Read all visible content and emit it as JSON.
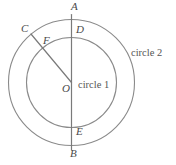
{
  "figure": {
    "width": 176,
    "height": 165,
    "background_color": "#ffffff",
    "stroke_color": "#8a8a8a",
    "label_color": "#4a4a4a"
  },
  "labels": {
    "A": "A",
    "B": "B",
    "C": "C",
    "D": "D",
    "E": "E",
    "F": "F",
    "O": "O",
    "circle_1": "circle 1",
    "circle_2": "circle 2"
  },
  "geometry": {
    "center": {
      "x": 71.5,
      "y": 82.5,
      "label": "O"
    },
    "circles": [
      {
        "name": "circle 1",
        "role": "inner",
        "cx": 71.5,
        "cy": 82.5,
        "r": 45.0
      },
      {
        "name": "circle 2",
        "role": "outer",
        "cx": 71.5,
        "cy": 82.5,
        "r": 63.0
      }
    ],
    "segments": [
      {
        "name": "diameter-AB",
        "from": "A",
        "to": "B",
        "x1": 71.5,
        "y1": 14.5,
        "x2": 71.5,
        "y2": 150.0
      },
      {
        "name": "radius-CO",
        "from": "C",
        "to": "O",
        "x1": 31.0,
        "y1": 34.0,
        "x2": 71.5,
        "y2": 82.5
      }
    ],
    "points": [
      {
        "id": "A",
        "x": 71.5,
        "y": 19.5,
        "note": "top of outer circle",
        "label_x": 71,
        "label_y": 1
      },
      {
        "id": "D",
        "x": 71.5,
        "y": 37.5,
        "note": "top of inner circle",
        "label_x": 76,
        "label_y": 24
      },
      {
        "id": "E",
        "x": 71.5,
        "y": 127.5,
        "note": "bottom of inner circle",
        "label_x": 76,
        "label_y": 126
      },
      {
        "id": "B",
        "x": 71.5,
        "y": 145.5,
        "note": "bottom of outer circle",
        "label_x": 70,
        "label_y": 148
      },
      {
        "id": "C",
        "x": 31.0,
        "y": 34.0,
        "note": "on outer circle",
        "label_x": 21,
        "label_y": 23
      },
      {
        "id": "F",
        "x": 48.5,
        "y": 55.0,
        "note": "intersection of CO with inner circle",
        "label_x": 43,
        "label_y": 35
      },
      {
        "id": "O",
        "x": 71.5,
        "y": 82.5,
        "note": "common center",
        "label_x": 62,
        "label_y": 83
      }
    ],
    "annotations": [
      {
        "id": "circle-1-label",
        "text": "circle 1",
        "x": 78,
        "y": 80
      },
      {
        "id": "circle-2-label",
        "text": "circle 2",
        "x": 131,
        "y": 48
      }
    ]
  }
}
